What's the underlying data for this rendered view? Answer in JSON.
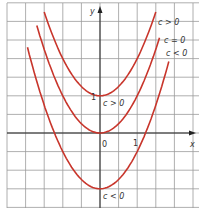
{
  "chart_data": {
    "type": "line",
    "title": "",
    "xlabel": "x",
    "ylabel": "y",
    "grid": true,
    "xlim": [
      -2.5,
      2.6
    ],
    "ylim": [
      -2.0,
      3.5
    ],
    "tick_labels": {
      "x_origin": "0",
      "x_one": "1",
      "y_one": "1"
    },
    "series": [
      {
        "name": "c > 0",
        "formula": "y = x^2 + 1",
        "c": 1,
        "x_range": [
          -1.5,
          1.5
        ],
        "color": "#c8352b",
        "label": "c > 0",
        "vertex_label": "c > 0"
      },
      {
        "name": "c = 0",
        "formula": "y = x^2",
        "c": 0,
        "x_range": [
          -1.7,
          1.6
        ],
        "color": "#c8352b",
        "label": "c = 0"
      },
      {
        "name": "c < 0",
        "formula": "y = x^2 - 1.5",
        "c": -1.5,
        "x_range": [
          -1.95,
          1.85
        ],
        "color": "#c8352b",
        "label": "c < 0",
        "vertex_label": "c < 0"
      }
    ],
    "annotations": [
      "c > 0",
      "c = 0",
      "c < 0",
      "c > 0",
      "c < 0"
    ]
  },
  "labels": {
    "x_axis": "x",
    "y_axis": "y",
    "origin": "0",
    "x_one": "1",
    "y_one": "1",
    "curve_top": "c > 0",
    "curve_mid": "c = 0",
    "curve_bot": "c < 0",
    "vertex_top": "c > 0",
    "vertex_bot": "c < 0"
  },
  "colors": {
    "curve": "#c8352b",
    "grid": "#9a9a9a",
    "axis": "#222222"
  }
}
